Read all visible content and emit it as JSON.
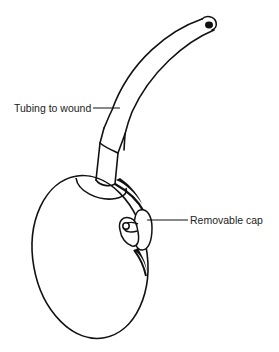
{
  "figure": {
    "type": "line-drawing",
    "stroke_color": "#111111",
    "background": "#ffffff"
  },
  "labels": {
    "tubing": "Tubing to wound",
    "cap": "Removable cap"
  }
}
